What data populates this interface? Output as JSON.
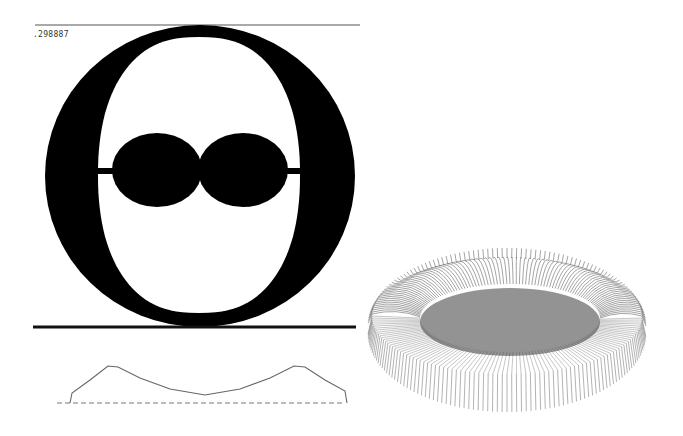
{
  "figure": {
    "value_label": ".298887",
    "colors": {
      "background": "#ffffff",
      "ink": "#000000",
      "profile_line": "#666666",
      "mesh_line": "#555555"
    },
    "cross_section": {
      "description": "Cross-section of a toroidal shape with an inner cavity and two central lobes",
      "top_rule": {
        "x1": 35,
        "x2": 360,
        "y": 25
      },
      "bottom_rule": {
        "x1": 33,
        "x2": 356,
        "y": 327
      },
      "outer_ellipse": {
        "cx": 200,
        "cy": 176,
        "rx": 155,
        "ry": 151
      },
      "inner_cavity": {
        "cx": 199,
        "cy": 175,
        "rx": 101,
        "ry": 138
      },
      "lobes": [
        {
          "cx": 157,
          "cy": 170,
          "rx": 45,
          "ry": 37
        },
        {
          "cx": 243,
          "cy": 170,
          "rx": 45,
          "ry": 37
        }
      ]
    },
    "profile_curve": {
      "baseline": {
        "x1": 57,
        "x2": 345,
        "y": 403,
        "style": "dashed"
      },
      "points": [
        [
          70,
          403
        ],
        [
          72,
          393
        ],
        [
          90,
          380
        ],
        [
          108,
          366
        ],
        [
          118,
          367
        ],
        [
          140,
          378
        ],
        [
          170,
          389
        ],
        [
          205,
          395
        ],
        [
          240,
          389
        ],
        [
          270,
          378
        ],
        [
          294,
          366
        ],
        [
          305,
          367
        ],
        [
          325,
          380
        ],
        [
          345,
          391
        ],
        [
          347,
          403
        ]
      ]
    },
    "surface_plot": {
      "description": "3D wireframe torus/donut surface rendered with radial mesh lines",
      "outer": {
        "cx": 507,
        "cy": 334,
        "rx": 139,
        "ry": 78
      },
      "inner_bowl": {
        "cx": 510,
        "cy": 318,
        "rx": 90,
        "ry": 34
      },
      "radial_line_count": 180
    }
  }
}
